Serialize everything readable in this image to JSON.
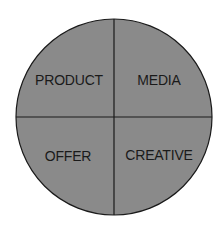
{
  "diagram": {
    "title": "",
    "shape": "circle-quadrants",
    "fill_color": "#8a8a8a",
    "stroke_color": "#1a1a1a",
    "quadrants": [
      {
        "position": "top-left",
        "label": "PRODUCT"
      },
      {
        "position": "top-right",
        "label": "MEDIA"
      },
      {
        "position": "bottom-left",
        "label": "OFFER"
      },
      {
        "position": "bottom-right",
        "label": "CREATIVE"
      }
    ]
  }
}
